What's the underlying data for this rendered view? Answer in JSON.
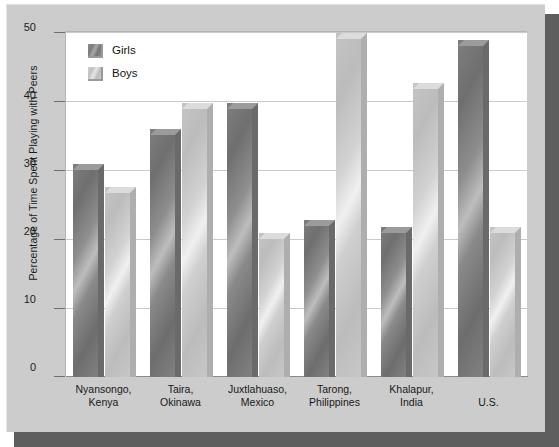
{
  "chart_data": {
    "type": "bar",
    "title": "",
    "subtitle": "",
    "xlabel": "",
    "ylabel": "Percentage of Time Spent Playing with Peers",
    "ylim": [
      0,
      50
    ],
    "yticks": [
      0,
      10,
      20,
      30,
      40,
      50
    ],
    "ytick_labels": [
      "0",
      "10",
      "20",
      "30",
      "40",
      "50"
    ],
    "grid": true,
    "legend_position": "top-left",
    "categories": [
      "Nyansongo,\nKenya",
      "Taira,\nOkinawa",
      "Juxtlahuaso,\nMexico",
      "Tarong,\nPhilippines",
      "Khalapur,\nIndia",
      "U.S."
    ],
    "category_lines": [
      [
        "Nyansongo,",
        "Kenya"
      ],
      [
        "Taira,",
        "Okinawa"
      ],
      [
        "Juxtlahuaso,",
        "Mexico"
      ],
      [
        "Tarong,",
        "Philippines"
      ],
      [
        "Khalapur,",
        "India"
      ],
      [
        "U.S.",
        ""
      ]
    ],
    "series": [
      {
        "name": "Girls",
        "color": "#7b7b7b",
        "values": [
          31,
          36,
          39.8,
          22.8,
          21.8,
          49
        ]
      },
      {
        "name": "Boys",
        "color": "#c8c8c8",
        "values": [
          27.6,
          39.8,
          21,
          50,
          42.8,
          21.8
        ]
      }
    ]
  },
  "legend": {
    "items": [
      {
        "label": "Girls",
        "swatch": "girls-swatch"
      },
      {
        "label": "Boys",
        "swatch": "boys-swatch"
      }
    ]
  },
  "axis": {
    "y_title": "Percentage of Time Spent Playing with Peers",
    "y_tick_labels": [
      "50",
      "40",
      "30",
      "20",
      "10",
      "0"
    ]
  },
  "colors": {
    "frame": "#cccccc",
    "shadow": "#5e5e5e",
    "panel": "#ffffff",
    "gridline": "#c9c9c9",
    "girls_bar": "#7b7b7b",
    "boys_bar": "#c8c8c8",
    "text": "#1a1a1a"
  }
}
